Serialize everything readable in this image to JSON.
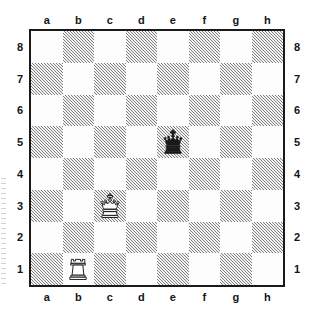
{
  "diagram": {
    "type": "chess-board",
    "orientation": "white-bottom",
    "files": [
      "a",
      "b",
      "c",
      "d",
      "e",
      "f",
      "g",
      "h"
    ],
    "ranks": [
      "8",
      "7",
      "6",
      "5",
      "4",
      "3",
      "2",
      "1"
    ],
    "labels": {
      "top_files": [
        "a",
        "b",
        "c",
        "d",
        "e",
        "f",
        "g",
        "h"
      ],
      "bottom_files": [
        "a",
        "b",
        "c",
        "d",
        "e",
        "f",
        "g",
        "h"
      ],
      "left_ranks": [
        "8",
        "7",
        "6",
        "5",
        "4",
        "3",
        "2",
        "1"
      ],
      "right_ranks": [
        "8",
        "7",
        "6",
        "5",
        "4",
        "3",
        "2",
        "1"
      ]
    },
    "colors": {
      "light_square": "#fdfdfd",
      "dark_square_hatch": "#3c3c3c",
      "border": "#1a1a1a",
      "label_text": "#141414",
      "piece_black": "#1a1a1a",
      "piece_white_outline": "#1a1a1a",
      "piece_white_fill": "#ffffff"
    },
    "pieces": [
      {
        "square": "e5",
        "file": "e",
        "rank": "5",
        "type": "king",
        "color": "black",
        "glyph": "black-king",
        "name": "Black King"
      },
      {
        "square": "c3",
        "file": "c",
        "rank": "3",
        "type": "king",
        "color": "white",
        "glyph": "white-king",
        "name": "White King"
      },
      {
        "square": "b1",
        "file": "b",
        "rank": "1",
        "type": "rook",
        "color": "white",
        "glyph": "white-rook",
        "name": "White Rook"
      }
    ],
    "piece_map": {
      "e5": "black-king",
      "c3": "white-king",
      "b1": "white-rook"
    },
    "fen": "8/8/8/4k3/8/2K5/8/1R6 w - - 0 1",
    "material": {
      "white": [
        "King c3",
        "Rook b1"
      ],
      "black": [
        "King e5"
      ]
    }
  }
}
